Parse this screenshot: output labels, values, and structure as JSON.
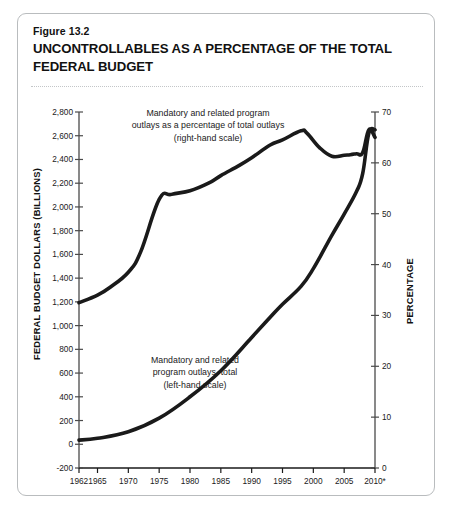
{
  "figure": {
    "number": "Figure 13.2",
    "title": "UNCONTROLLABLES AS A PERCENTAGE OF THE TOTAL FEDERAL BUDGET"
  },
  "chart_data": {
    "type": "line",
    "title": "UNCONTROLLABLES AS A PERCENTAGE OF THE TOTAL FEDERAL BUDGET",
    "xlabel": "",
    "ylabel": "FEDERAL BUDGET DOLLARS (BILLIONS)",
    "y2label": "PERCENTAGE",
    "grid": false,
    "legend_position": "inline-annotation",
    "xlim": [
      1962,
      2010
    ],
    "ylim": [
      -200,
      2800
    ],
    "y2lim": [
      0,
      70
    ],
    "xticks": [
      1962,
      1965,
      1970,
      1975,
      1980,
      1985,
      1990,
      1995,
      2000,
      2005,
      2010
    ],
    "xticklabels": [
      "1962",
      "1965",
      "1970",
      "1975",
      "1980",
      "1985",
      "1990",
      "1995",
      "2000",
      "2005",
      "2010*"
    ],
    "yticks": [
      -200,
      0,
      200,
      400,
      600,
      800,
      1000,
      1200,
      1400,
      1600,
      1800,
      2000,
      2200,
      2400,
      2600,
      2800
    ],
    "yticklabels": [
      "-200",
      "0",
      "200",
      "400",
      "600",
      "800",
      "1,000",
      "1,200",
      "1,400",
      "1,600",
      "1,800",
      "2,000",
      "2,200",
      "2,400",
      "2,600",
      "2,800"
    ],
    "y2ticks": [
      0,
      10,
      20,
      30,
      40,
      50,
      60,
      70
    ],
    "y2ticklabels": [
      "0",
      "10",
      "20",
      "30",
      "40",
      "50",
      "60",
      "70"
    ],
    "series": [
      {
        "name": "Mandatory and related program outlays as a percentage of total outlays (right-hand scale)",
        "axis": "right",
        "units": "percent",
        "color": "#1a1a1a",
        "x": [
          1962,
          1965,
          1967,
          1970,
          1972,
          1975,
          1977,
          1980,
          1983,
          1985,
          1988,
          1990,
          1993,
          1995,
          1998,
          1999,
          2001,
          2003,
          2005,
          2006,
          2007,
          2008,
          2009,
          2010
        ],
        "values": [
          32.5,
          34.0,
          35.5,
          38.5,
          42.5,
          52.8,
          53.8,
          54.5,
          56.0,
          57.5,
          59.5,
          61.0,
          63.5,
          64.5,
          66.3,
          65.8,
          63.0,
          61.3,
          61.5,
          61.6,
          61.8,
          62.0,
          66.5,
          65.0
        ]
      },
      {
        "name": "Mandatory and related program outlays, total (left-hand scale)",
        "axis": "left",
        "units": "billions of dollars",
        "color": "#1a1a1a",
        "x": [
          1962,
          1965,
          1970,
          1975,
          1980,
          1985,
          1990,
          1993,
          1995,
          1998,
          2000,
          2003,
          2005,
          2007,
          2008,
          2009,
          2010
        ],
        "values": [
          35,
          50,
          105,
          220,
          400,
          620,
          900,
          1070,
          1180,
          1330,
          1480,
          1760,
          1940,
          2130,
          2280,
          2620,
          2650
        ]
      }
    ],
    "annotations": [
      {
        "id": "pct-label",
        "lines": [
          "Mandatory and related program",
          "outlays as a percentage of total outlays",
          "(right-hand scale)"
        ]
      },
      {
        "id": "dollars-label",
        "lines": [
          "Mandatory and related",
          "program outlays, total",
          "(left-hand scale)"
        ]
      }
    ],
    "footnote_marker": "*"
  },
  "colors": {
    "line": "#1a1a1a",
    "axis": "#4a4a4a",
    "frame": "#b9bcbe",
    "text": "#111111"
  }
}
